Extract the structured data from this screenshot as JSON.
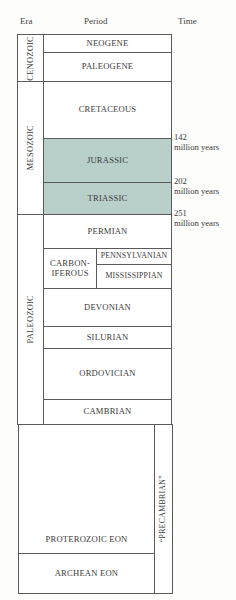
{
  "headers": {
    "era": "Era",
    "period": "Period",
    "time": "Time"
  },
  "eras": [
    {
      "name": "CENOZOIC",
      "periods": [
        "NEOGENE",
        "PALEOGENE"
      ]
    },
    {
      "name": "MESOZOIC",
      "periods": [
        "CRETACEOUS",
        "JURASSIC",
        "TRIASSIC"
      ]
    },
    {
      "name": "PALEOZOIC",
      "periods": [
        "PERMIAN",
        "CARBON-IFEROUS",
        "DEVONIAN",
        "SILURIAN",
        "ORDOVICIAN",
        "CAMBRIAN"
      ]
    }
  ],
  "carboniferous": {
    "label_line1": "CARBON-",
    "label_line2": "IFEROUS",
    "sub": [
      "PENNSYLVANIAN",
      "MISSISSIPPIAN"
    ]
  },
  "precambrian": {
    "label": "“PRECAMBRIAN”",
    "eons": [
      "PROTEROZOIC EON",
      "ARCHEAN EON"
    ]
  },
  "times": [
    {
      "value": "142",
      "unit": "million years"
    },
    {
      "value": "202",
      "unit": "million years"
    },
    {
      "value": "251",
      "unit": "million years"
    }
  ],
  "colors": {
    "highlight": "#b8d0c9",
    "line": "#5a5a5a"
  }
}
